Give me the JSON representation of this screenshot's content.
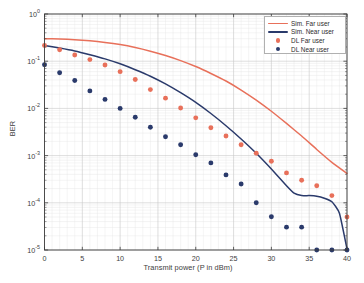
{
  "chart_data": {
    "type": "scatter",
    "title": "",
    "xlabel": "Transmit power (P in dBm)",
    "ylabel": "BER",
    "xlim": [
      0,
      40
    ],
    "ylim": [
      1e-05,
      1
    ],
    "yscale": "log",
    "xscale": "linear",
    "grid": true,
    "minor_grid": true,
    "legend_position": "upper right",
    "xticks": [
      0,
      5,
      10,
      15,
      20,
      25,
      30,
      35,
      40
    ],
    "xtick_labels": [
      "0",
      "5",
      "10",
      "15",
      "20",
      "25",
      "30",
      "35",
      "40"
    ],
    "yticks": [
      1,
      0.1,
      0.01,
      0.001,
      0.0001,
      1e-05
    ],
    "ytick_labels": [
      "10 0",
      "10 -1",
      "10 -2",
      "10 -3",
      "10 -4",
      "10 -5"
    ],
    "ytick_mantissa": "10",
    "ytick_exponents": [
      "0",
      "-1",
      "-2",
      "-3",
      "-4",
      "-5"
    ],
    "series": [
      {
        "name": "Sim. Far user",
        "style": "line",
        "color": "#E8705A",
        "x": [
          0,
          2,
          4,
          6,
          8,
          10,
          12,
          14,
          16,
          18,
          20,
          22,
          24,
          26,
          28,
          30,
          32,
          34,
          36,
          38,
          40
        ],
        "values": [
          0.3,
          0.295,
          0.285,
          0.27,
          0.25,
          0.225,
          0.195,
          0.163,
          0.132,
          0.103,
          0.077,
          0.055,
          0.038,
          0.0245,
          0.015,
          0.0087,
          0.0048,
          0.0026,
          0.00135,
          0.00072,
          0.00042
        ]
      },
      {
        "name": "Sim. Near user",
        "style": "line",
        "color": "#2A3A6B",
        "x": [
          0,
          2,
          4,
          6,
          8,
          10,
          12,
          14,
          16,
          18,
          20,
          22,
          24,
          26,
          28,
          30,
          32,
          33,
          34,
          35,
          36,
          37,
          38,
          39,
          40
        ],
        "values": [
          0.215,
          0.19,
          0.165,
          0.137,
          0.112,
          0.088,
          0.066,
          0.048,
          0.033,
          0.0215,
          0.0134,
          0.0078,
          0.0043,
          0.00225,
          0.00112,
          0.00052,
          0.00023,
          0.00016,
          0.000142,
          0.000142,
          0.000138,
          0.000125,
          0.000105,
          6e-05,
          1.05e-05
        ]
      },
      {
        "name": "DL Far user",
        "style": "markers",
        "color": "#E8705A",
        "x": [
          0,
          2,
          4,
          6,
          8,
          10,
          12,
          14,
          16,
          18,
          20,
          22,
          24,
          26,
          28,
          30,
          32,
          34,
          36,
          38,
          40
        ],
        "values": [
          0.215,
          0.175,
          0.135,
          0.108,
          0.083,
          0.06,
          0.041,
          0.025,
          0.0165,
          0.0102,
          0.0063,
          0.0039,
          0.0026,
          0.0017,
          0.00112,
          0.00076,
          0.00043,
          0.0003,
          0.00023,
          0.000142,
          5e-05
        ]
      },
      {
        "name": "DL Near user",
        "style": "markers",
        "color": "#2A3A6B",
        "x": [
          0,
          2,
          4,
          6,
          8,
          10,
          12,
          14,
          16,
          18,
          20,
          22,
          24,
          26,
          28,
          30,
          32,
          34,
          36,
          38,
          40
        ],
        "values": [
          0.084,
          0.057,
          0.039,
          0.0235,
          0.0155,
          0.01,
          0.0065,
          0.004,
          0.0025,
          0.0017,
          0.00104,
          0.0007,
          0.00039,
          0.00025,
          0.0001,
          5.05e-05,
          3.05e-05,
          3.05e-05,
          1e-05,
          1e-05,
          1e-05
        ]
      }
    ]
  },
  "legend": {
    "items": [
      {
        "label": "Sim. Far user",
        "kind": "line",
        "color": "#E8705A"
      },
      {
        "label": "Sim. Near user",
        "kind": "line",
        "color": "#2A3A6B"
      },
      {
        "label": "DL Far user",
        "kind": "marker",
        "color": "#E8705A"
      },
      {
        "label": "DL Near user",
        "kind": "marker",
        "color": "#2A3A6B"
      }
    ]
  },
  "colors": {
    "far_user": "#E8705A",
    "near_user": "#2A3A6B",
    "axis": "#3d3d3d",
    "grid_major": "#c8c8c8",
    "grid_minor": "#e6e6e6",
    "background": "#ffffff"
  }
}
